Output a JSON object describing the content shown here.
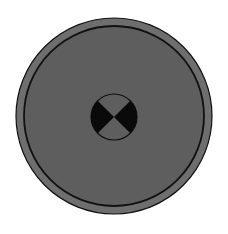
{
  "figure": {
    "colors": {
      "background": "#ffffff",
      "outer_ring": "#6e6e6e",
      "disc_fill": "#5e5e5e",
      "outline": "#111111",
      "marker_dark": "#0a0a0a",
      "marker_light": "#5e5e5e"
    },
    "outer_circle": {
      "cx": 114,
      "cy": 116,
      "r": 98
    },
    "inner_circle": {
      "cx": 114,
      "cy": 116,
      "r": 90
    },
    "center_marker": {
      "cx": 114,
      "cy": 117,
      "r": 23,
      "icon": "crash-test-target-icon"
    }
  }
}
